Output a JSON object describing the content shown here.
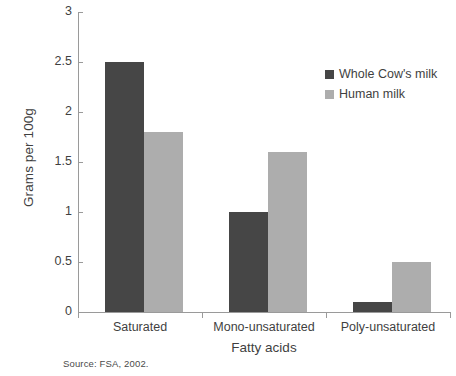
{
  "chart_data": {
    "type": "bar",
    "title": "",
    "subtitle": "",
    "xlabel": "Fatty acids",
    "ylabel": "Grams per 100g",
    "categories": [
      "Saturated",
      "Mono-unsaturated",
      "Poly-unsaturated"
    ],
    "series": [
      {
        "name": "Whole Cow's milk",
        "values": [
          2.5,
          1.0,
          0.1
        ],
        "color": "#464646"
      },
      {
        "name": "Human milk",
        "values": [
          1.8,
          1.6,
          0.5
        ],
        "color": "#adadad"
      }
    ],
    "ylim": [
      0,
      3
    ],
    "ytick_labels": [
      "0",
      "0.5",
      "1",
      "1.5",
      "2",
      "2.5",
      "3"
    ],
    "ytick_values": [
      0,
      0.5,
      1,
      1.5,
      2,
      2.5,
      3
    ],
    "grid": false,
    "legend_position": "top-right",
    "annotations": [
      "Source: FSA, 2002."
    ]
  },
  "axes": {
    "y_title": "Grams per 100g",
    "x_title": "Fatty acids"
  },
  "legend": {
    "entries": [
      {
        "label": "Whole Cow's milk"
      },
      {
        "label": "Human milk"
      }
    ]
  },
  "footer": {
    "source": "Source: FSA, 2002."
  }
}
